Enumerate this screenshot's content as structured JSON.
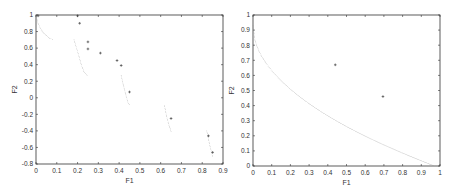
{
  "chart_data": [
    {
      "type": "scatter",
      "title": "",
      "xlabel": "F1",
      "ylabel": "F2",
      "xlim": [
        0,
        0.9
      ],
      "ylim": [
        -0.8,
        1
      ],
      "xticks": [
        "0",
        "0.1",
        "0.2",
        "0.3",
        "0.4",
        "0.5",
        "0.6",
        "0.7",
        "0.8",
        "0.9"
      ],
      "xtick_values": [
        0,
        0.1,
        0.2,
        0.3,
        0.4,
        0.5,
        0.6,
        0.7,
        0.8,
        0.9
      ],
      "yticks": [
        "-0.8",
        "-0.6",
        "-0.4",
        "-0.2",
        "0",
        "0.2",
        "0.4",
        "0.6",
        "0.8",
        "1"
      ],
      "ytick_values": [
        -0.8,
        -0.6,
        -0.4,
        -0.2,
        0,
        0.2,
        0.4,
        0.6,
        0.8,
        1
      ],
      "grid": false,
      "series": [
        {
          "name": "true-pareto-front",
          "style": "dotted",
          "segments": [
            [
              [
                0.0,
                1.0
              ],
              [
                0.01,
                0.9
              ],
              [
                0.025,
                0.82
              ],
              [
                0.045,
                0.76
              ],
              [
                0.065,
                0.72
              ],
              [
                0.085,
                0.7
              ]
            ],
            [
              [
                0.183,
                0.7
              ],
              [
                0.195,
                0.6
              ],
              [
                0.207,
                0.5
              ],
              [
                0.218,
                0.4
              ],
              [
                0.23,
                0.32
              ],
              [
                0.25,
                0.26
              ]
            ],
            [
              [
                0.41,
                0.27
              ],
              [
                0.418,
                0.18
              ],
              [
                0.426,
                0.1
              ],
              [
                0.434,
                0.02
              ],
              [
                0.442,
                -0.05
              ],
              [
                0.452,
                -0.1
              ]
            ],
            [
              [
                0.618,
                -0.09
              ],
              [
                0.625,
                -0.18
              ],
              [
                0.632,
                -0.26
              ],
              [
                0.64,
                -0.33
              ],
              [
                0.652,
                -0.42
              ]
            ],
            [
              [
                0.822,
                -0.4
              ],
              [
                0.83,
                -0.5
              ],
              [
                0.838,
                -0.59
              ],
              [
                0.845,
                -0.66
              ],
              [
                0.852,
                -0.73
              ]
            ]
          ]
        },
        {
          "name": "obtained-solutions",
          "style": "plus",
          "points": [
            [
              0.01,
              0.99
            ],
            [
              0.2,
              0.99
            ],
            [
              0.21,
              0.9
            ],
            [
              0.25,
              0.675
            ],
            [
              0.25,
              0.59
            ],
            [
              0.31,
              0.54
            ],
            [
              0.39,
              0.45
            ],
            [
              0.41,
              0.39
            ],
            [
              0.45,
              0.07
            ],
            [
              0.65,
              -0.25
            ],
            [
              0.83,
              -0.46
            ],
            [
              0.85,
              -0.66
            ]
          ]
        }
      ]
    },
    {
      "type": "scatter",
      "title": "",
      "xlabel": "F1",
      "ylabel": "F2",
      "xlim": [
        0,
        1
      ],
      "ylim": [
        0,
        1
      ],
      "xticks": [
        "0",
        "0.1",
        "0.2",
        "0.3",
        "0.4",
        "0.5",
        "0.6",
        "0.7",
        "0.8",
        "0.9",
        "1"
      ],
      "xtick_values": [
        0,
        0.1,
        0.2,
        0.3,
        0.4,
        0.5,
        0.6,
        0.7,
        0.8,
        0.9,
        1
      ],
      "yticks": [
        "0",
        "0.1",
        "0.2",
        "0.3",
        "0.4",
        "0.5",
        "0.6",
        "0.7",
        "0.8",
        "0.9",
        "1"
      ],
      "ytick_values": [
        0,
        0.1,
        0.2,
        0.3,
        0.4,
        0.5,
        0.6,
        0.7,
        0.8,
        0.9,
        1
      ],
      "grid": false,
      "series": [
        {
          "name": "true-pareto-front",
          "style": "dotted",
          "function": "f2 = 0.93 - 0.93*sqrt(f1/0.97)",
          "x_range": [
            0,
            0.97
          ]
        },
        {
          "name": "obtained-solutions",
          "style": "plus",
          "points": [
            [
              0.44,
              0.67
            ],
            [
              0.695,
              0.46
            ]
          ]
        }
      ]
    }
  ]
}
